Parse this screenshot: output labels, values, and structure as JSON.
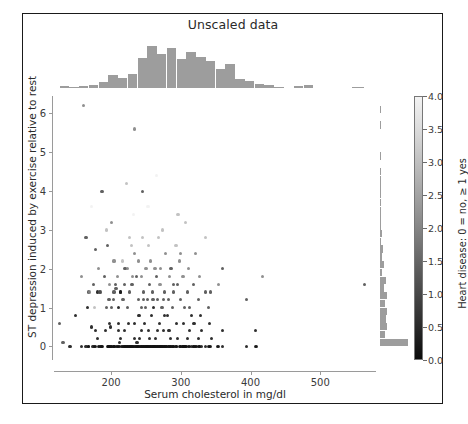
{
  "figure": {
    "title": "Unscaled data",
    "background": "#ffffff",
    "frame_color": "#1a1a1a"
  },
  "chart_data": {
    "type": "scatter",
    "title": "Unscaled data",
    "xlabel": "Serum cholesterol in mg/dl",
    "ylabel": "ST depression induced by exercise relative to rest",
    "xlim": [
      118,
      580
    ],
    "ylim": [
      -0.35,
      6.45
    ],
    "xticks": [
      200,
      300,
      400,
      500
    ],
    "yticks": [
      0,
      1,
      2,
      3,
      4,
      5,
      6
    ],
    "grid": false,
    "legend": "colorbar-right",
    "colormap": "binary_r",
    "marker_size_px": 3.2,
    "colorbar": {
      "label": "Heart disease: 0 = no, ≥ 1 yes",
      "ticks": [
        0.0,
        0.5,
        1.0,
        1.5,
        2.0,
        2.5,
        3.0,
        3.5,
        4.0
      ],
      "tick_labels": [
        "0.0",
        "0.5",
        "1.0",
        "1.5",
        "2.0",
        "2.5",
        "3.0",
        "3.5",
        "4.0"
      ],
      "vmin": 0.0,
      "vmax": 4.0,
      "low_color": "#0b0b0b",
      "high_color": "#f3f3f3",
      "orientation": "vertical"
    },
    "marginal_x": {
      "type": "histogram",
      "color": "#9d9d9d",
      "bin_edges": [
        126,
        140,
        154,
        168,
        182,
        196,
        210,
        224,
        238,
        252,
        266,
        280,
        294,
        308,
        322,
        336,
        350,
        364,
        378,
        392,
        406,
        420,
        434,
        448,
        462,
        476,
        490,
        504,
        518,
        532,
        546,
        564
      ],
      "counts": [
        2,
        1,
        2,
        3,
        5,
        12,
        9,
        13,
        27,
        38,
        31,
        36,
        26,
        33,
        28,
        24,
        17,
        22,
        8,
        6,
        4,
        3,
        1,
        0,
        2,
        3,
        0,
        0,
        0,
        0,
        1
      ]
    },
    "marginal_y": {
      "type": "histogram",
      "color": "#9d9d9d",
      "bin_edges": [
        0.0,
        0.2,
        0.4,
        0.6,
        0.8,
        1.0,
        1.2,
        1.4,
        1.6,
        1.8,
        2.0,
        2.2,
        2.4,
        2.6,
        2.8,
        3.0,
        3.2,
        3.4,
        3.6,
        3.8,
        4.0,
        4.2,
        4.4,
        4.6,
        4.8,
        5.0,
        5.2,
        5.4,
        5.6,
        5.8,
        6.0,
        6.2
      ],
      "counts": [
        99,
        17,
        26,
        22,
        25,
        16,
        25,
        14,
        20,
        8,
        15,
        6,
        9,
        5,
        7,
        3,
        4,
        2,
        3,
        1,
        2,
        1,
        1,
        0,
        1,
        0,
        0,
        0,
        1,
        0,
        1
      ]
    },
    "points": [
      [
        126,
        0.6,
        1
      ],
      [
        131,
        0.1,
        1
      ],
      [
        141,
        0.0,
        0
      ],
      [
        149,
        0.8,
        0
      ],
      [
        157,
        0.0,
        0
      ],
      [
        160,
        6.2,
        2
      ],
      [
        164,
        0.0,
        0
      ],
      [
        166,
        1.0,
        0
      ],
      [
        167,
        0.0,
        0
      ],
      [
        168,
        1.4,
        1
      ],
      [
        169,
        1.4,
        2
      ],
      [
        172,
        0.5,
        0
      ],
      [
        174,
        0.0,
        0
      ],
      [
        175,
        1.6,
        1
      ],
      [
        176,
        1.0,
        3
      ],
      [
        177,
        0.4,
        0
      ],
      [
        177,
        2.5,
        1
      ],
      [
        178,
        0.0,
        0
      ],
      [
        180,
        1.4,
        0
      ],
      [
        182,
        0.0,
        0
      ],
      [
        182,
        2.0,
        2
      ],
      [
        183,
        1.4,
        1
      ],
      [
        184,
        0.0,
        0
      ],
      [
        185,
        1.4,
        1
      ],
      [
        186,
        0.0,
        0
      ],
      [
        187,
        4.0,
        1
      ],
      [
        188,
        0.0,
        0
      ],
      [
        192,
        0.4,
        0
      ],
      [
        193,
        1.0,
        1
      ],
      [
        193,
        3.0,
        3
      ],
      [
        195,
        0.0,
        0
      ],
      [
        195,
        2.6,
        1
      ],
      [
        196,
        0.0,
        0
      ],
      [
        197,
        0.0,
        0
      ],
      [
        197,
        1.2,
        1
      ],
      [
        198,
        0.6,
        0
      ],
      [
        198,
        1.6,
        2
      ],
      [
        199,
        0.5,
        0
      ],
      [
        199,
        0.0,
        0
      ],
      [
        200,
        0.0,
        0
      ],
      [
        201,
        0.0,
        0
      ],
      [
        201,
        1.0,
        1
      ],
      [
        203,
        0.0,
        0
      ],
      [
        204,
        0.0,
        0
      ],
      [
        204,
        1.4,
        1
      ],
      [
        204,
        2.2,
        2
      ],
      [
        205,
        0.0,
        0
      ],
      [
        206,
        1.6,
        1
      ],
      [
        207,
        1.5,
        1
      ],
      [
        208,
        0.0,
        0
      ],
      [
        209,
        0.0,
        0
      ],
      [
        209,
        1.8,
        2
      ],
      [
        211,
        0.0,
        0
      ],
      [
        211,
        1.0,
        0
      ],
      [
        212,
        0.0,
        0
      ],
      [
        212,
        0.1,
        0
      ],
      [
        213,
        0.2,
        0
      ],
      [
        213,
        1.4,
        1
      ],
      [
        214,
        1.4,
        0
      ],
      [
        215,
        0.0,
        0
      ],
      [
        216,
        0.0,
        0
      ],
      [
        216,
        2.2,
        3
      ],
      [
        217,
        1.2,
        1
      ],
      [
        218,
        0.0,
        0
      ],
      [
        219,
        0.0,
        0
      ],
      [
        219,
        1.6,
        1
      ],
      [
        220,
        0.0,
        0
      ],
      [
        220,
        2.0,
        1
      ],
      [
        221,
        0.0,
        0
      ],
      [
        222,
        0.0,
        0
      ],
      [
        223,
        0.0,
        0
      ],
      [
        223,
        1.0,
        1
      ],
      [
        224,
        0.0,
        0
      ],
      [
        224,
        2.0,
        2
      ],
      [
        225,
        0.0,
        0
      ],
      [
        225,
        0.6,
        0
      ],
      [
        226,
        0.0,
        0
      ],
      [
        226,
        1.4,
        1
      ],
      [
        227,
        0.0,
        0
      ],
      [
        228,
        0.0,
        0
      ],
      [
        229,
        0.0,
        0
      ],
      [
        229,
        2.6,
        3
      ],
      [
        230,
        0.0,
        0
      ],
      [
        230,
        1.6,
        1
      ],
      [
        231,
        0.0,
        0
      ],
      [
        232,
        0.0,
        0
      ],
      [
        232,
        3.4,
        4
      ],
      [
        233,
        0.6,
        0
      ],
      [
        233,
        0.0,
        0
      ],
      [
        234,
        0.2,
        0
      ],
      [
        234,
        2.4,
        2
      ],
      [
        235,
        0.0,
        0
      ],
      [
        236,
        0.0,
        0
      ],
      [
        236,
        1.8,
        1
      ],
      [
        237,
        0.0,
        0
      ],
      [
        237,
        0.1,
        0
      ],
      [
        238,
        0.0,
        0
      ],
      [
        239,
        0.0,
        0
      ],
      [
        239,
        1.2,
        1
      ],
      [
        240,
        0.0,
        0
      ],
      [
        240,
        0.8,
        0
      ],
      [
        241,
        0.2,
        0
      ],
      [
        242,
        0.0,
        0
      ],
      [
        243,
        0.0,
        0
      ],
      [
        243,
        1.0,
        1
      ],
      [
        244,
        0.0,
        0
      ],
      [
        244,
        1.8,
        2
      ],
      [
        245,
        0.0,
        0
      ],
      [
        245,
        2.8,
        3
      ],
      [
        246,
        0.0,
        0
      ],
      [
        246,
        1.4,
        1
      ],
      [
        247,
        0.0,
        0
      ],
      [
        248,
        0.0,
        0
      ],
      [
        248,
        0.6,
        0
      ],
      [
        249,
        0.0,
        0
      ],
      [
        249,
        1.0,
        1
      ],
      [
        250,
        0.0,
        0
      ],
      [
        250,
        2.0,
        2
      ],
      [
        251,
        0.0,
        0
      ],
      [
        252,
        0.0,
        0
      ],
      [
        252,
        1.2,
        1
      ],
      [
        253,
        0.0,
        0
      ],
      [
        253,
        3.6,
        4
      ],
      [
        254,
        0.0,
        0
      ],
      [
        254,
        0.4,
        0
      ],
      [
        255,
        0.0,
        0
      ],
      [
        255,
        1.6,
        1
      ],
      [
        256,
        0.0,
        0
      ],
      [
        256,
        2.2,
        2
      ],
      [
        257,
        0.0,
        0
      ],
      [
        258,
        0.0,
        0
      ],
      [
        258,
        0.8,
        0
      ],
      [
        259,
        0.0,
        0
      ],
      [
        259,
        1.4,
        1
      ],
      [
        260,
        0.0,
        0
      ],
      [
        261,
        0.0,
        0
      ],
      [
        261,
        1.0,
        0
      ],
      [
        262,
        0.0,
        0
      ],
      [
        263,
        0.0,
        0
      ],
      [
        263,
        2.0,
        2
      ],
      [
        264,
        0.0,
        0
      ],
      [
        264,
        0.2,
        0
      ],
      [
        265,
        0.0,
        0
      ],
      [
        265,
        1.8,
        1
      ],
      [
        266,
        0.0,
        0
      ],
      [
        267,
        0.0,
        0
      ],
      [
        267,
        1.2,
        1
      ],
      [
        268,
        0.0,
        0
      ],
      [
        268,
        2.8,
        3
      ],
      [
        269,
        0.0,
        0
      ],
      [
        269,
        0.6,
        0
      ],
      [
        270,
        0.0,
        0
      ],
      [
        270,
        1.6,
        2
      ],
      [
        271,
        0.0,
        0
      ],
      [
        272,
        0.0,
        0
      ],
      [
        273,
        0.0,
        0
      ],
      [
        273,
        1.0,
        1
      ],
      [
        274,
        0.0,
        0
      ],
      [
        274,
        3.0,
        3
      ],
      [
        275,
        0.0,
        0
      ],
      [
        275,
        0.4,
        0
      ],
      [
        276,
        0.0,
        0
      ],
      [
        276,
        1.4,
        1
      ],
      [
        277,
        0.0,
        0
      ],
      [
        278,
        0.0,
        0
      ],
      [
        278,
        2.4,
        2
      ],
      [
        279,
        0.0,
        0
      ],
      [
        280,
        0.0,
        0
      ],
      [
        281,
        0.8,
        0
      ],
      [
        282,
        0.0,
        0
      ],
      [
        282,
        1.2,
        1
      ],
      [
        283,
        0.0,
        0
      ],
      [
        284,
        1.8,
        2
      ],
      [
        285,
        0.0,
        0
      ],
      [
        286,
        0.0,
        0
      ],
      [
        286,
        2.0,
        1
      ],
      [
        288,
        0.0,
        0
      ],
      [
        288,
        1.0,
        1
      ],
      [
        289,
        0.0,
        0
      ],
      [
        290,
        0.0,
        0
      ],
      [
        290,
        1.4,
        1
      ],
      [
        293,
        0.0,
        0
      ],
      [
        293,
        2.6,
        3
      ],
      [
        294,
        0.0,
        0
      ],
      [
        294,
        0.6,
        0
      ],
      [
        295,
        1.6,
        1
      ],
      [
        298,
        0.0,
        0
      ],
      [
        298,
        2.2,
        2
      ],
      [
        299,
        0.0,
        0
      ],
      [
        300,
        0.0,
        0
      ],
      [
        300,
        1.2,
        1
      ],
      [
        302,
        0.0,
        0
      ],
      [
        303,
        0.0,
        0
      ],
      [
        303,
        1.8,
        2
      ],
      [
        304,
        0.0,
        0
      ],
      [
        305,
        0.0,
        0
      ],
      [
        305,
        1.0,
        1
      ],
      [
        306,
        0.0,
        0
      ],
      [
        307,
        0.0,
        0
      ],
      [
        307,
        3.2,
        3
      ],
      [
        308,
        0.0,
        0
      ],
      [
        309,
        1.4,
        1
      ],
      [
        311,
        0.0,
        0
      ],
      [
        311,
        2.0,
        2
      ],
      [
        313,
        0.0,
        0
      ],
      [
        315,
        0.0,
        0
      ],
      [
        315,
        0.8,
        0
      ],
      [
        318,
        0.0,
        0
      ],
      [
        318,
        1.6,
        1
      ],
      [
        319,
        0.0,
        0
      ],
      [
        321,
        0.0,
        0
      ],
      [
        321,
        2.4,
        2
      ],
      [
        322,
        0.0,
        0
      ],
      [
        325,
        1.2,
        1
      ],
      [
        326,
        0.0,
        0
      ],
      [
        327,
        0.0,
        0
      ],
      [
        327,
        1.8,
        2
      ],
      [
        330,
        0.0,
        0
      ],
      [
        330,
        0.4,
        0
      ],
      [
        335,
        0.0,
        0
      ],
      [
        335,
        2.8,
        3
      ],
      [
        340,
        0.0,
        0
      ],
      [
        340,
        1.0,
        1
      ],
      [
        341,
        0.0,
        0
      ],
      [
        342,
        0.0,
        0
      ],
      [
        342,
        1.4,
        1
      ],
      [
        353,
        0.0,
        0
      ],
      [
        354,
        0.0,
        0
      ],
      [
        354,
        1.6,
        2
      ],
      [
        360,
        0.0,
        0
      ],
      [
        360,
        2.0,
        1
      ],
      [
        394,
        0.0,
        0
      ],
      [
        394,
        1.2,
        1
      ],
      [
        407,
        0.0,
        0
      ],
      [
        409,
        0.0,
        0
      ],
      [
        417,
        1.8,
        2
      ],
      [
        564,
        1.6,
        1
      ],
      [
        168,
        0.0,
        0
      ],
      [
        176,
        0.0,
        0
      ],
      [
        186,
        0.0,
        0
      ],
      [
        197,
        0.0,
        0
      ],
      [
        203,
        1.2,
        1
      ],
      [
        211,
        0.6,
        0
      ],
      [
        219,
        0.4,
        0
      ],
      [
        226,
        2.8,
        3
      ],
      [
        231,
        1.8,
        2
      ],
      [
        239,
        2.2,
        2
      ],
      [
        243,
        0.4,
        0
      ],
      [
        247,
        1.2,
        1
      ],
      [
        254,
        2.6,
        3
      ],
      [
        260,
        1.2,
        1
      ],
      [
        266,
        0.4,
        0
      ],
      [
        271,
        2.0,
        2
      ],
      [
        277,
        0.8,
        0
      ],
      [
        283,
        0.4,
        0
      ],
      [
        289,
        1.6,
        1
      ],
      [
        295,
        0.2,
        0
      ],
      [
        300,
        2.4,
        2
      ],
      [
        304,
        0.6,
        0
      ],
      [
        309,
        0.2,
        0
      ],
      [
        313,
        1.0,
        1
      ],
      [
        319,
        0.6,
        0
      ],
      [
        325,
        0.2,
        0
      ],
      [
        335,
        1.4,
        1
      ],
      [
        341,
        0.6,
        0
      ],
      [
        157,
        1.8,
        2
      ],
      [
        164,
        2.8,
        1
      ],
      [
        172,
        3.6,
        4
      ],
      [
        180,
        0.2,
        0
      ],
      [
        190,
        1.8,
        1
      ],
      [
        200,
        3.2,
        2
      ],
      [
        210,
        0.4,
        0
      ],
      [
        222,
        4.2,
        3
      ],
      [
        234,
        5.6,
        2
      ],
      [
        245,
        4.0,
        1
      ],
      [
        255,
        0.2,
        0
      ],
      [
        265,
        4.4,
        4
      ],
      [
        275,
        1.2,
        1
      ],
      [
        285,
        0.2,
        0
      ],
      [
        296,
        3.4,
        3
      ],
      [
        312,
        0.4,
        0
      ],
      [
        328,
        0.8,
        0
      ],
      [
        344,
        0.2,
        0
      ],
      [
        360,
        0.4,
        0
      ],
      [
        407,
        0.4,
        0
      ]
    ]
  },
  "axes": {
    "xticks_labels": [
      "200",
      "300",
      "400",
      "500"
    ],
    "yticks_labels": [
      "0",
      "1",
      "2",
      "3",
      "4",
      "5",
      "6"
    ]
  }
}
